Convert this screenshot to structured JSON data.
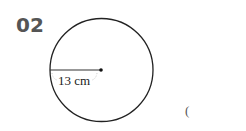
{
  "problem": {
    "number": "02",
    "answer_open_paren": "("
  },
  "figure": {
    "shape": "circle",
    "radius_label": "13 cm",
    "radius_value": 13,
    "unit": "cm",
    "colors": {
      "stroke": "#222222",
      "number": "#555555"
    }
  }
}
